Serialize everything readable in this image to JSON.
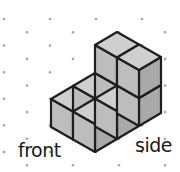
{
  "figure": {
    "labels": {
      "front": "front",
      "side": "side"
    },
    "colors": {
      "dot": "#a6a6a6",
      "top_face": "#cfcfcf",
      "left_face": "#bdbdbd",
      "right_face": "#a9a9a9",
      "edge": "#1e1e1e"
    },
    "cube_count": 8,
    "cubes": [
      {
        "i": 1,
        "j": 0,
        "k": 0
      },
      {
        "i": 1,
        "j": 1,
        "k": 0
      },
      {
        "i": 1,
        "j": 2,
        "k": 0
      },
      {
        "i": 0,
        "j": 0,
        "k": 0
      },
      {
        "i": 0,
        "j": 1,
        "k": 0
      },
      {
        "i": 0,
        "j": 2,
        "k": 0
      },
      {
        "i": 1,
        "j": 2,
        "k": 1
      },
      {
        "i": 0,
        "j": 2,
        "k": 1
      }
    ]
  }
}
